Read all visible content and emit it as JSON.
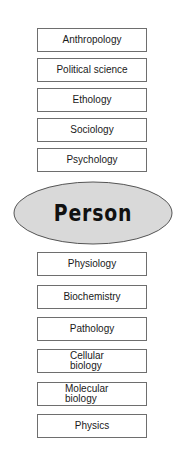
{
  "diagram": {
    "center": {
      "label": "Person",
      "fill": "#d9d9d9",
      "stroke": "#555555"
    },
    "upper_levels": [
      {
        "label": "Anthropology"
      },
      {
        "label": "Political science"
      },
      {
        "label": "Ethology"
      },
      {
        "label": "Sociology"
      },
      {
        "label": "Psychology"
      }
    ],
    "lower_levels": [
      {
        "label": "Physiology"
      },
      {
        "label": "Biochemistry"
      },
      {
        "label": "Pathology"
      },
      {
        "label": "Cellular\nbiology"
      },
      {
        "label": "Molecular\nbiology"
      },
      {
        "label": "Physics"
      }
    ],
    "box_border_color": "#6e6e6e"
  }
}
